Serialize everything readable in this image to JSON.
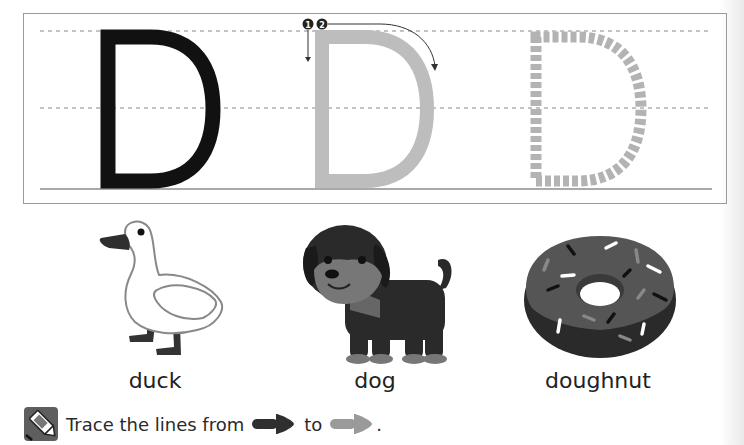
{
  "worksheet": {
    "letter": "D",
    "stroke_order": [
      "1",
      "2"
    ],
    "colors": {
      "solid_letter": "#111111",
      "trace_letter": "#bdbdbd",
      "dotted_letter": "#b3b3b3",
      "guide_line": "#888888"
    }
  },
  "pictures": [
    {
      "name": "duck",
      "label": "duck"
    },
    {
      "name": "dog",
      "label": "dog"
    },
    {
      "name": "doughnut",
      "label": "doughnut"
    }
  ],
  "instruction": {
    "icon": "crayon-icon",
    "text_before": "Trace the lines from",
    "text_middle": "to",
    "text_end": ".",
    "start_arrow_color": "#2f2f2f",
    "end_arrow_color": "#9a9a9a"
  }
}
